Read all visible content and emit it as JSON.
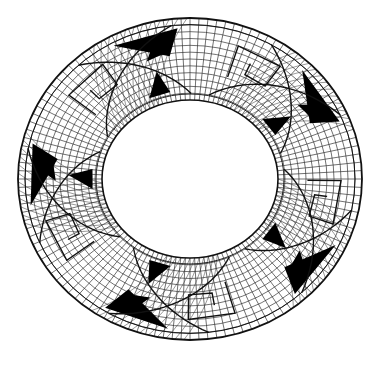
{
  "figure": {
    "kind": "decorative-ring-pattern",
    "background": "#ffffff",
    "ink": "#111111",
    "fill": "#000000",
    "center": [
      190,
      179
    ],
    "outer_radius": [
      172,
      161
    ],
    "border_band": 7,
    "inner_radius": [
      88,
      79
    ],
    "hatch_rings": 12,
    "hatch_spokes": 120,
    "motifs": 5
  }
}
